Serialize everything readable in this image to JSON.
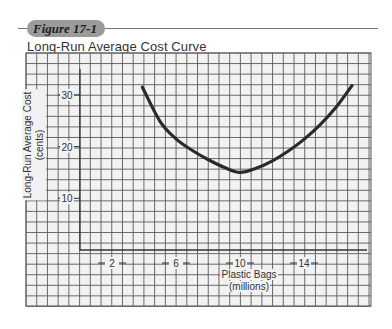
{
  "figure": {
    "badge": "Figure 17-1",
    "title": "Long-Run Average Cost Curve"
  },
  "axes": {
    "ylabel_line1": "Long-Run Average Cost",
    "ylabel_line2": "(cents)",
    "xlabel_line1": "Plastic Bags",
    "xlabel_line2": "(millions)"
  },
  "colors": {
    "grid": "#5a5a5a",
    "paper": "#f2f2f2",
    "curve": "#2a2a2a",
    "badge": "#9b9b9b"
  },
  "chart_data": {
    "type": "line",
    "title": "Long-Run Average Cost Curve",
    "xlabel": "Plastic Bags (millions)",
    "ylabel": "Long-Run Average Cost (cents)",
    "x_ticks": [
      2,
      6,
      10,
      14
    ],
    "y_ticks": [
      10,
      20,
      30
    ],
    "xlim": [
      0,
      18
    ],
    "ylim": [
      0,
      33
    ],
    "grid": true,
    "legend": null,
    "series": [
      {
        "name": "LRAC",
        "x": [
          3.9,
          5.0,
          6.0,
          7.0,
          8.0,
          9.0,
          10.0,
          11.0,
          12.0,
          13.0,
          14.0,
          15.0,
          16.0,
          17.0
        ],
        "values": [
          31.5,
          24.9,
          21.5,
          19.3,
          17.5,
          16.0,
          15.0,
          15.8,
          17.2,
          19.1,
          21.4,
          24.2,
          27.6,
          31.8
        ]
      }
    ]
  }
}
